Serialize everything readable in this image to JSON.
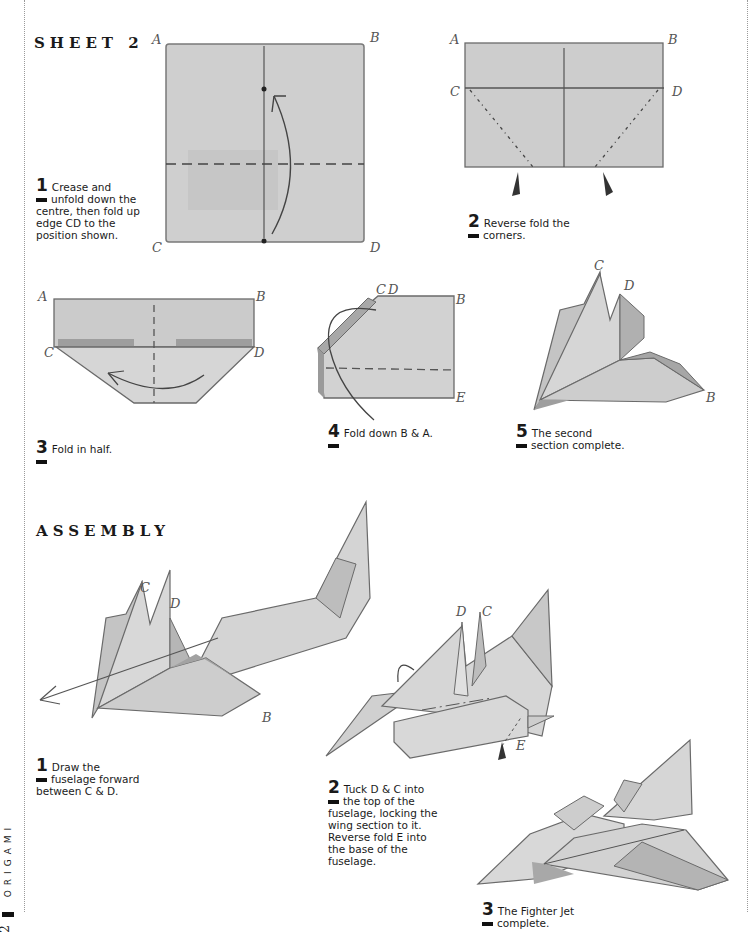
{
  "page": {
    "folio_label": "ORIGAMI",
    "page_number": "2"
  },
  "sheet2": {
    "title": "SHEET 2",
    "steps": [
      {
        "num": "1",
        "lines": [
          "Crease and",
          "unfold down the",
          "centre, then fold up",
          "edge CD to the",
          "position shown."
        ],
        "labels": [
          "A",
          "B",
          "C",
          "D"
        ]
      },
      {
        "num": "2",
        "lines": [
          "Reverse fold the",
          "corners."
        ],
        "labels": [
          "A",
          "B",
          "C",
          "D"
        ]
      },
      {
        "num": "3",
        "lines": [
          "Fold in half."
        ],
        "labels": [
          "A",
          "B",
          "C",
          "D"
        ]
      },
      {
        "num": "4",
        "lines": [
          "Fold down B & A."
        ],
        "labels": [
          "C",
          "D",
          "B",
          "E"
        ]
      },
      {
        "num": "5",
        "lines": [
          "The second",
          "section complete."
        ],
        "labels": [
          "C",
          "D",
          "B"
        ]
      }
    ]
  },
  "assembly": {
    "title": "ASSEMBLY",
    "steps": [
      {
        "num": "1",
        "lines": [
          "Draw the",
          "fuselage forward",
          "between C & D."
        ],
        "labels": [
          "C",
          "D",
          "B"
        ]
      },
      {
        "num": "2",
        "lines": [
          "Tuck D & C into",
          "the top of the",
          "fuselage, locking the",
          "wing section to it.",
          "Reverse fold E into",
          "the base of the",
          "fuselage."
        ],
        "labels": [
          "D",
          "C",
          "E"
        ]
      },
      {
        "num": "3",
        "lines": [
          "The Fighter Jet",
          "complete."
        ]
      }
    ]
  },
  "colors": {
    "paper": "#c9c9c9",
    "paper_light": "#dcdcdc",
    "paper_dark": "#a9a9a9",
    "line": "#555555",
    "text": "#1a1a1a"
  }
}
